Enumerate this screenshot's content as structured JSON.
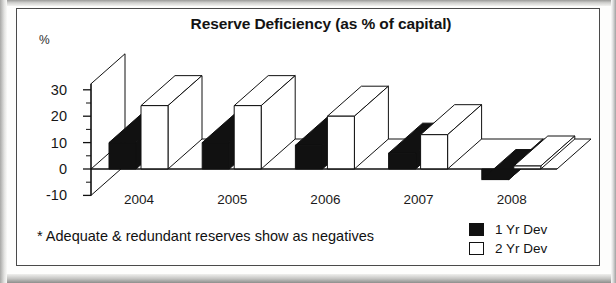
{
  "chart_data": {
    "type": "bar",
    "title": "Reserve Deficiency (as % of capital)",
    "subtitle": "",
    "xlabel": "",
    "ylabel": "%",
    "categories": [
      "2004",
      "2005",
      "2006",
      "2007",
      "2008"
    ],
    "series": [
      {
        "name": "1 Yr Dev",
        "values": [
          10,
          10,
          9,
          6,
          -4
        ],
        "color": "#111111"
      },
      {
        "name": "2 Yr Dev",
        "values": [
          24,
          24,
          20,
          13,
          1
        ],
        "color": "#ffffff"
      }
    ],
    "ylim": [
      -10,
      30
    ],
    "yticks": [
      -10,
      0,
      10,
      20,
      30
    ],
    "ytick_labels": [
      "-10",
      "0",
      "10",
      "20",
      "30"
    ],
    "minor_tick_interval": 5,
    "grid": false,
    "legend_position": "bottom-right",
    "style": "3d-perspective-bar",
    "annotation": "* Adequate & redundant reserves show as negatives"
  },
  "chart": {
    "title": "Reserve Deficiency (as % of capital)",
    "unit_label": "%",
    "footnote": "* Adequate & redundant reserves show as negatives"
  },
  "legend": {
    "items": [
      {
        "label": "1 Yr Dev",
        "fill": "#111111"
      },
      {
        "label": "2 Yr Dev",
        "fill": "#ffffff"
      }
    ]
  },
  "colors": {
    "ink": "#111111",
    "frame": "#4a4a4a",
    "series_1": "#111111",
    "series_2": "#ffffff",
    "paper": "#ffffff"
  }
}
